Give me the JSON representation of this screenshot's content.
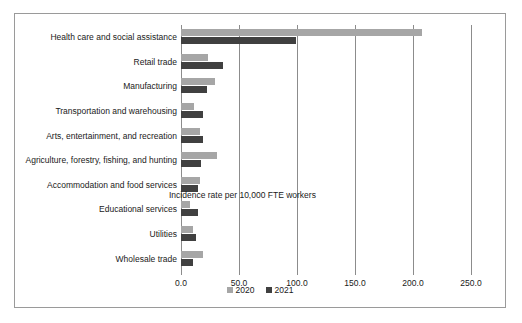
{
  "chart_data": {
    "type": "bar",
    "orientation": "horizontal",
    "title": "",
    "subtitle": "",
    "annotation": "Incidence rate per 10,000 FTE workers",
    "xlabel": "",
    "ylabel": "",
    "xlim": [
      0.0,
      250.0
    ],
    "xticks": [
      "0.0",
      "50.0",
      "100.0",
      "150.0",
      "200.0",
      "250.0"
    ],
    "xtick_values": [
      0.0,
      50.0,
      100.0,
      150.0,
      200.0,
      250.0
    ],
    "grid": true,
    "grid_axis": "x",
    "legend_position": "bottom-center",
    "categories": [
      "Health care and social assistance",
      "Retail trade",
      "Manufacturing",
      "Transportation and warehousing",
      "Arts, entertainment, and recreation",
      "Agriculture, forestry, fishing, and hunting",
      "Accommodation and food services",
      "Educational services",
      "Utilities",
      "Wholesale trade"
    ],
    "series": [
      {
        "name": "2020",
        "color": "#a6a6a6",
        "values": [
          208.0,
          23.0,
          29.0,
          11.0,
          16.0,
          31.0,
          16.0,
          8.0,
          10.0,
          19.0
        ]
      },
      {
        "name": "2021",
        "color": "#404040",
        "values": [
          99.0,
          36.0,
          22.0,
          19.0,
          19.0,
          17.0,
          15.0,
          15.0,
          13.0,
          10.0
        ]
      }
    ]
  },
  "legend": {
    "items": [
      {
        "label": "2020",
        "color": "#a6a6a6"
      },
      {
        "label": "2021",
        "color": "#404040"
      }
    ]
  },
  "colors": {
    "series_2020": "#a6a6a6",
    "series_2021": "#404040",
    "gridline": "#8c8c8c",
    "frame_border": "#9a9a9a",
    "text": "#1a1a1a",
    "background": "#ffffff"
  }
}
